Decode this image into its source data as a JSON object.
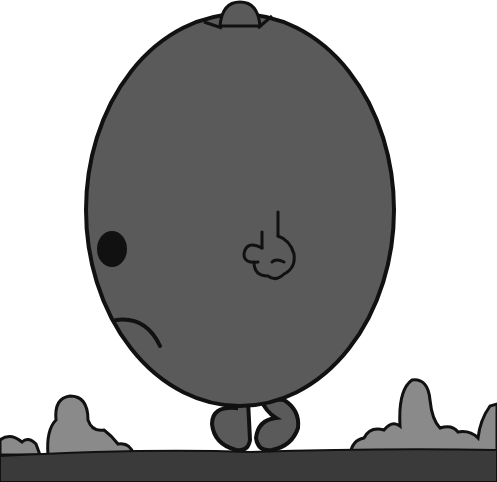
{
  "scene": {
    "subject": "Round grey character with a small hat walking on ground",
    "colors": {
      "body": "#5a5a5a",
      "outline": "#111111",
      "bushes": "#8a8a8a",
      "ground": "#3a3a3a",
      "background": "#ffffff"
    }
  }
}
